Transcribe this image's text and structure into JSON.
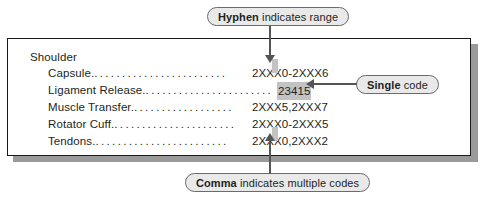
{
  "figure": {
    "index_box": {
      "group_title": "Shoulder",
      "entries": [
        {
          "term": "Capsule.",
          "leader": "........................",
          "code": "2XXX0-2XXX6",
          "highlighted": false
        },
        {
          "term": "Ligament Release.",
          "leader": ".......................",
          "code": "23415",
          "highlighted": true
        },
        {
          "term": "Muscle Transfer.",
          "leader": "..................",
          "code": "2XXX5,2XXX7",
          "highlighted": false
        },
        {
          "term": "Rotator Cuff.",
          "leader": "......................",
          "code": "2XXX0-2XXX5",
          "highlighted": false
        },
        {
          "term": "Tendons.",
          "leader": "........................",
          "code": "2XXX0,2XXX2",
          "highlighted": false
        }
      ]
    },
    "callouts": [
      {
        "id": "hyphen",
        "emphasis": "Hyphen",
        "text": " indicates range",
        "arrow": "down",
        "target": "hyphen in 2XXX0-2XXX6"
      },
      {
        "id": "single",
        "emphasis": "Single",
        "text": " code",
        "arrow": "left",
        "target": "23415"
      },
      {
        "id": "comma",
        "emphasis": "Comma",
        "text": " indicates multiple codes",
        "arrow": "up",
        "target": "comma in 2XXX0,2XXX2"
      }
    ],
    "colors": {
      "box_border": "#1a1a1a",
      "box_shadow": "#9a9a9a",
      "highlight": "#c3c3c3",
      "arrow": "#555555",
      "pill_fill": "#e9e9e9",
      "pill_border": "#6b6b6b",
      "text": "#231f20"
    }
  }
}
